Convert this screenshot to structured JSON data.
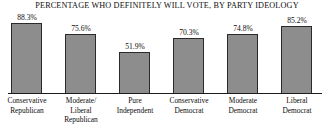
{
  "chart_data": {
    "type": "bar",
    "title": "PERCENTAGE WHO DEFINITELY WILL VOTE, BY PARTY IDEOLOGY",
    "xlabel": "",
    "ylabel": "",
    "ylim": [
      0,
      100
    ],
    "grid": false,
    "legend": false,
    "value_suffix": "%",
    "bar_color": "#8d8d8d",
    "bar_border_color": "#2a2a2a",
    "background_color": "#ffffff",
    "text_color": "#0d0d0d",
    "categories": [
      "Conservative Republican",
      "Moderate/ Liberal Republican",
      "Pure Independent",
      "Conservative Democrat",
      "Moderate Democrat",
      "Liberal Democrat"
    ],
    "category_lines": [
      [
        "Conservative",
        "Republican"
      ],
      [
        "Moderate/",
        "Liberal",
        "Republican"
      ],
      [
        "Pure",
        "Independent"
      ],
      [
        "Conservative",
        "Democrat"
      ],
      [
        "Moderate",
        "Democrat"
      ],
      [
        "Liberal",
        "Democrat"
      ]
    ],
    "values": [
      88.3,
      75.6,
      51.9,
      70.3,
      74.8,
      85.2
    ],
    "value_labels": [
      "88.3%",
      "75.6%",
      "51.9%",
      "70.3%",
      "74.8%",
      "85.2%"
    ]
  }
}
